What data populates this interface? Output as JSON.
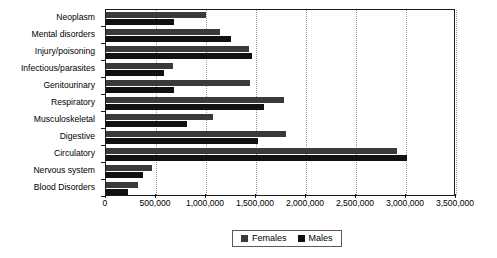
{
  "chart_data": {
    "type": "bar",
    "orientation": "horizontal",
    "title": "",
    "subtitle": "",
    "xlabel": "",
    "ylabel": "",
    "xlim": [
      0,
      3500000
    ],
    "xticks": [
      0,
      500000,
      1000000,
      1500000,
      2000000,
      2500000,
      3000000,
      3500000
    ],
    "xtick_labels": [
      "0",
      "500,000",
      "1,000,000",
      "1,500,000",
      "2,000,000",
      "2,500,000",
      "3,000,000",
      "3,500,000"
    ],
    "grid": "vertical-dotted",
    "legend_position": "bottom-center",
    "categories": [
      "Neoplasm",
      "Mental disorders",
      "Injury/poisoning",
      "Infectious/parasites",
      "Genitourinary",
      "Respiratory",
      "Musculoskeletal",
      "Digestive",
      "Circulatory",
      "Nervous system",
      "Blood Disorders"
    ],
    "series": [
      {
        "name": "Females",
        "color": "#3a3a3a",
        "values": [
          1000000,
          1140000,
          1430000,
          670000,
          1440000,
          1780000,
          1070000,
          1800000,
          2910000,
          460000,
          320000
        ]
      },
      {
        "name": "Males",
        "color": "#111111",
        "values": [
          680000,
          1250000,
          1460000,
          580000,
          680000,
          1580000,
          810000,
          1520000,
          3010000,
          370000,
          220000
        ]
      }
    ],
    "legend": [
      {
        "label": "Females",
        "color": "#3a3a3a"
      },
      {
        "label": "Males",
        "color": "#111111"
      }
    ]
  }
}
